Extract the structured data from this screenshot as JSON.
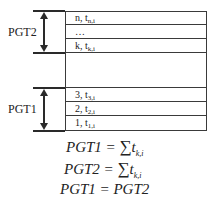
{
  "diagram": {
    "groups": [
      {
        "label": "PGT2"
      },
      {
        "label": "PGT1"
      }
    ],
    "rows_top": [
      {
        "main": "n, t",
        "sub": "n,i"
      },
      {
        "main": "…",
        "sub": ""
      },
      {
        "main": "k, t",
        "sub": "k,i"
      }
    ],
    "rows_bottom": [
      {
        "main": "3, t",
        "sub": "3,i"
      },
      {
        "main": "2, t",
        "sub": "2,i"
      },
      {
        "main": "1, t",
        "sub": "1,i"
      }
    ],
    "formulas": [
      {
        "lhs": "PGT1 = ",
        "sum": "∑",
        "var": "t",
        "sub": "k,i"
      },
      {
        "lhs": "PGT2 = ",
        "sum": "∑",
        "var": "t",
        "sub": "k,i"
      },
      {
        "text": "PGT1 = PGT2"
      }
    ]
  }
}
